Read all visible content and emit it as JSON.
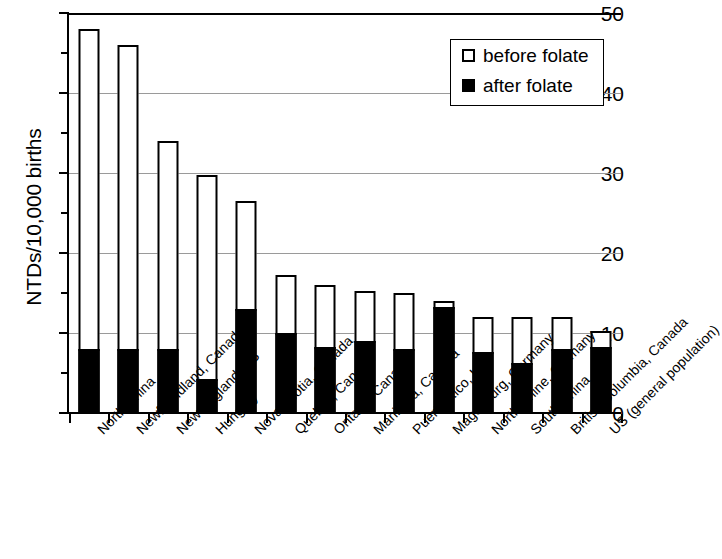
{
  "chart_data": {
    "type": "bar",
    "stacked": true,
    "title": "",
    "xlabel": "",
    "ylabel": "NTDs/10,000 births",
    "ylim": [
      0,
      50
    ],
    "yticks": [
      0,
      10,
      20,
      30,
      40,
      50
    ],
    "ytick_labels": [
      "0",
      "10",
      "20",
      "30",
      "40",
      "50"
    ],
    "minor_yticks": [
      5,
      15,
      25,
      35,
      45
    ],
    "grid": "horizontal",
    "legend_position": "top-right",
    "categories": [
      "North China",
      "Newfoundland, Canada",
      "New England, US",
      "Hungary",
      "Nova Scotia, Canada",
      "Quebec, Canada",
      "Ontario, Canada",
      "Manitoba, Canada",
      "Puerto Rico, US",
      "Magdeburg, Germany",
      "North Rhine, Germany",
      "South China",
      "British Columbia, Canada",
      "US (general population)"
    ],
    "series": [
      {
        "name": "before folate",
        "color": "#ffffff",
        "values": [
          48,
          46,
          34,
          29.7,
          26.5,
          17.2,
          16,
          15.2,
          15,
          14,
          12,
          12,
          12,
          10.2
        ]
      },
      {
        "name": "after folate",
        "color": "#000000",
        "values": [
          8,
          8,
          8,
          4.2,
          13,
          10,
          8.2,
          9,
          8,
          13.3,
          7.6,
          6.3,
          8,
          8.3
        ]
      }
    ]
  },
  "legend": {
    "items": [
      {
        "label": "before folate",
        "swatch": "empty"
      },
      {
        "label": "after folate",
        "swatch": "filled"
      }
    ]
  },
  "axis": {
    "y_title": "NTDs/10,000 births"
  }
}
